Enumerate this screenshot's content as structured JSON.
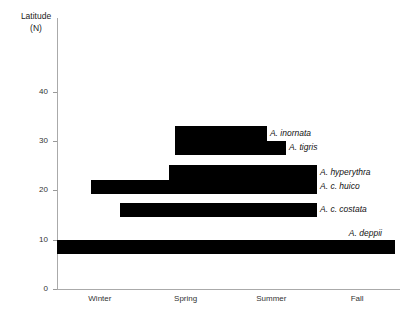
{
  "chart_data": {
    "type": "bar",
    "orientation": "horizontal-range",
    "title": "",
    "ylabel": "Latitude (N)",
    "ylabel_lines": [
      "Latitude",
      "(N)"
    ],
    "xlabel": "",
    "ylim": [
      0,
      44
    ],
    "yticks": [
      0,
      10,
      20,
      30,
      40
    ],
    "ytick_labels": [
      "0",
      "10",
      "20",
      "30",
      "40"
    ],
    "categories": [
      "Winter",
      "Spring",
      "Summer",
      "Fall"
    ],
    "grid": false,
    "legend": "none",
    "bar_color": "#000000",
    "axis_color": "#aaaaaa",
    "series": [
      {
        "name": "A. inornata",
        "label": "A. inornata",
        "lat_min": 30.0,
        "lat_max": 33.0,
        "season_start": "Spring",
        "season_end": "Summer",
        "x_start_frac": 0.344,
        "x_end_frac": 0.612
      },
      {
        "name": "A. tigris",
        "label": "A. tigris",
        "lat_min": 27.2,
        "lat_max": 30.0,
        "season_start": "Spring",
        "season_end": "Summer",
        "x_start_frac": 0.344,
        "x_end_frac": 0.668
      },
      {
        "name": "A. hyperythra",
        "label": "A. hyperythra",
        "lat_min": 22.1,
        "lat_max": 25.1,
        "season_start": "Spring",
        "season_end": "Fall",
        "x_start_frac": 0.326,
        "x_end_frac": 0.758
      },
      {
        "name": "A. c. huico",
        "label": "A. c. huico",
        "lat_min": 19.3,
        "lat_max": 22.1,
        "season_start": "Winter",
        "season_end": "Fall",
        "x_start_frac": 0.099,
        "x_end_frac": 0.758
      },
      {
        "name": "A. c. costata",
        "label": "A. c. costata",
        "lat_min": 14.6,
        "lat_max": 17.4,
        "season_start": "Winter",
        "season_end": "Fall",
        "x_start_frac": 0.184,
        "x_end_frac": 0.758
      },
      {
        "name": "A. deppii",
        "label": "A. deppii",
        "lat_min": 7.1,
        "lat_max": 9.9,
        "season_start": "Winter",
        "season_end": "Fall",
        "x_start_frac": 0.0,
        "x_end_frac": 0.985
      }
    ]
  }
}
